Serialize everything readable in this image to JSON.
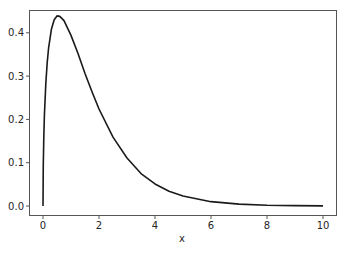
{
  "chart_data": {
    "type": "line",
    "title": "",
    "xlabel": "x",
    "ylabel": "",
    "xlim": [
      -0.5,
      10.5
    ],
    "ylim": [
      -0.021,
      0.45
    ],
    "grid": false,
    "legend": null,
    "x_ticks": [
      0,
      2,
      4,
      6,
      8,
      10
    ],
    "x_tick_labels": [
      "0",
      "2",
      "4",
      "6",
      "8",
      "10"
    ],
    "y_ticks": [
      0.0,
      0.1,
      0.2,
      0.3,
      0.4
    ],
    "y_tick_labels": [
      "0.0",
      "0.1",
      "0.2",
      "0.3",
      "0.4"
    ],
    "series": [
      {
        "name": "pdf",
        "color": "#1a1a1a",
        "x": [
          0,
          0.01,
          0.03,
          0.05,
          0.1,
          0.15,
          0.2,
          0.3,
          0.4,
          0.5,
          0.6,
          0.75,
          1.0,
          1.25,
          1.5,
          1.75,
          2.0,
          2.5,
          3.0,
          3.5,
          4.0,
          4.5,
          5.0,
          6.0,
          7.0,
          8.0,
          9.0,
          10.0
        ],
        "y": [
          0,
          0.094,
          0.163,
          0.209,
          0.282,
          0.331,
          0.365,
          0.408,
          0.43,
          0.439,
          0.438,
          0.428,
          0.394,
          0.352,
          0.306,
          0.264,
          0.224,
          0.159,
          0.111,
          0.075,
          0.051,
          0.034,
          0.023,
          0.01,
          0.0044,
          0.0019,
          0.0008,
          0.0003
        ]
      }
    ]
  },
  "axes": {
    "xlabel": "x"
  }
}
